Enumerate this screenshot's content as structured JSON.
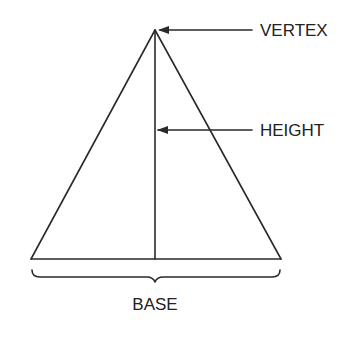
{
  "diagram": {
    "labels": {
      "vertex": "VERTEX",
      "height": "HEIGHT",
      "base": "BASE"
    },
    "stroke_color": "#2a2a2a",
    "text_color": "#222222"
  }
}
